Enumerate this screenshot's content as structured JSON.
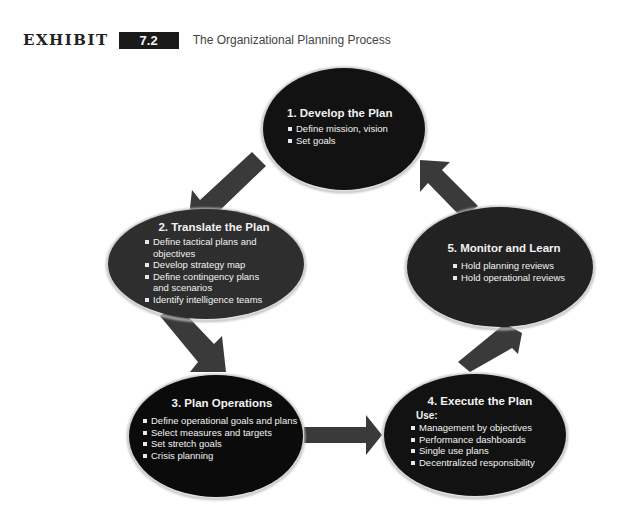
{
  "header": {
    "exhibit_label": "EXHIBIT",
    "exhibit_number": "7.2",
    "title": "The Organizational Planning Process"
  },
  "colors": {
    "node_black": "#0d0d0d",
    "node_gray": "#2e2e2e",
    "arrow": "#3a3a3a",
    "text": "#f2f2f2"
  },
  "nodes": [
    {
      "title": "1. Develop the Plan",
      "items": [
        "Define mission, vision",
        "Set goals"
      ]
    },
    {
      "title": "2. Translate the Plan",
      "items": [
        "Define tactical plans and",
        "objectives",
        "Develop strategy map",
        "Define contingency plans",
        "and scenarios",
        "Identify intelligence teams"
      ]
    },
    {
      "title": "3. Plan Operations",
      "items": [
        "Define operational goals and plans",
        "Select measures and targets",
        "Set stretch goals",
        "Crisis planning"
      ]
    },
    {
      "title": "4. Execute the Plan",
      "subheading": "Use:",
      "items": [
        "Management by objectives",
        "Performance dashboards",
        "Single use plans",
        "Decentralized responsibility"
      ]
    },
    {
      "title": "5. Monitor and Learn",
      "items": [
        "Hold planning reviews",
        "Hold operational reviews"
      ]
    }
  ],
  "flow": [
    "1 → 2",
    "2 → 3",
    "3 → 4",
    "4 → 5",
    "5 → 1"
  ]
}
